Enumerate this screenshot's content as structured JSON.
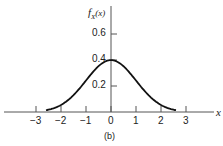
{
  "chart_data": {
    "type": "line",
    "title": "",
    "caption": "(b)",
    "xlabel": "x",
    "ylabel": "f_X(x)",
    "x_ticks": [
      "-3",
      "-2",
      "-1",
      "0",
      "1",
      "2",
      "3"
    ],
    "y_ticks": [
      "0.2",
      "0.4",
      "0.6"
    ],
    "xlim": [
      -3.0,
      3.0
    ],
    "ylim": [
      0,
      0.7
    ],
    "grid": false,
    "legend": null,
    "series": [
      {
        "name": "standard normal pdf",
        "x": [
          -2.6,
          -2.4,
          -2.2,
          -2.0,
          -1.8,
          -1.6,
          -1.4,
          -1.2,
          -1.0,
          -0.8,
          -0.6,
          -0.4,
          -0.2,
          0.0,
          0.2,
          0.4,
          0.6,
          0.8,
          1.0,
          1.2,
          1.4,
          1.6,
          1.8,
          2.0,
          2.2,
          2.4,
          2.6
        ],
        "values": [
          0.014,
          0.022,
          0.035,
          0.054,
          0.079,
          0.111,
          0.15,
          0.194,
          0.242,
          0.29,
          0.333,
          0.368,
          0.391,
          0.399,
          0.391,
          0.368,
          0.333,
          0.29,
          0.242,
          0.194,
          0.15,
          0.111,
          0.079,
          0.054,
          0.035,
          0.022,
          0.014
        ]
      }
    ]
  },
  "labels": {
    "y_axis": "f",
    "y_axis_sub": "X",
    "y_axis_arg": "(x)",
    "x_axis": "x",
    "caption": "(b)",
    "xt": [
      "−3",
      "−2",
      "−1",
      "0",
      "1",
      "2",
      "3"
    ],
    "yt": [
      "0.2",
      "0.4",
      "0.6"
    ]
  }
}
